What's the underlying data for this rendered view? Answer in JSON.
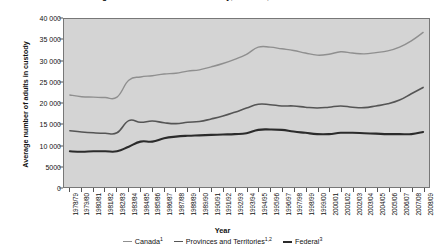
{
  "chart_data": {
    "type": "line",
    "title": "Average number of adults in custody, Canada, 1978/1979 to 2008/2009",
    "xlabel": "Year",
    "ylabel": "Average number of adults in custody",
    "ylim": [
      0,
      40000
    ],
    "yticks": [
      "0",
      "5000",
      "10 000",
      "15 000",
      "20 000",
      "25 000",
      "30 000",
      "35 000",
      "40 000"
    ],
    "ytick_values": [
      0,
      5000,
      10000,
      15000,
      20000,
      25000,
      30000,
      35000,
      40000
    ],
    "grid": false,
    "legend_position": "bottom",
    "categories": [
      "1978/79",
      "1979/80",
      "1980/81",
      "1981/82",
      "1982/83",
      "1983/84",
      "1984/85",
      "1985/86",
      "1986/87",
      "1987/88",
      "1988/89",
      "1989/90",
      "1990/91",
      "1991/92",
      "1992/93",
      "1993/94",
      "1994/95",
      "1995/96",
      "1996/97",
      "1997/98",
      "1998/99",
      "1999/00",
      "2000/01",
      "2001/02",
      "2002/03",
      "2003/04",
      "2004/05",
      "2005/06",
      "2006/07",
      "2007/08",
      "2008/09"
    ],
    "series": [
      {
        "name": "Canada",
        "footnote": "1",
        "color": "#8f8f8f",
        "width": 1.4,
        "values": [
          21900,
          21500,
          21400,
          21300,
          21400,
          25400,
          26200,
          26500,
          26900,
          27100,
          27600,
          27900,
          28600,
          29400,
          30400,
          31600,
          33300,
          33300,
          32900,
          32500,
          31900,
          31400,
          31600,
          32200,
          31900,
          31700,
          32000,
          32400,
          33300,
          34800,
          36800
        ]
      },
      {
        "name": "Provinces and Territories",
        "footnote": "1,2",
        "color": "#555555",
        "width": 1.6,
        "values": [
          13400,
          13100,
          12900,
          12800,
          12900,
          15800,
          15400,
          15700,
          15300,
          15100,
          15400,
          15600,
          16200,
          16900,
          17800,
          18800,
          19700,
          19600,
          19300,
          19300,
          19000,
          18800,
          19000,
          19300,
          19000,
          18900,
          19300,
          19800,
          20700,
          22200,
          23700
        ]
      },
      {
        "name": "Federal",
        "footnote": "3",
        "color": "#2b2b2b",
        "width": 2.1,
        "values": [
          8500,
          8400,
          8500,
          8500,
          8500,
          9600,
          10800,
          10800,
          11600,
          12000,
          12200,
          12300,
          12400,
          12500,
          12600,
          12800,
          13600,
          13700,
          13600,
          13200,
          12900,
          12600,
          12600,
          12900,
          12900,
          12800,
          12700,
          12600,
          12600,
          12600,
          13100
        ]
      }
    ]
  },
  "legend": {
    "items": [
      {
        "label": "Canada",
        "footnote": "1"
      },
      {
        "label": "Provinces and Territories",
        "footnote": "1,2"
      },
      {
        "label": "Federal",
        "footnote": "3"
      }
    ]
  }
}
